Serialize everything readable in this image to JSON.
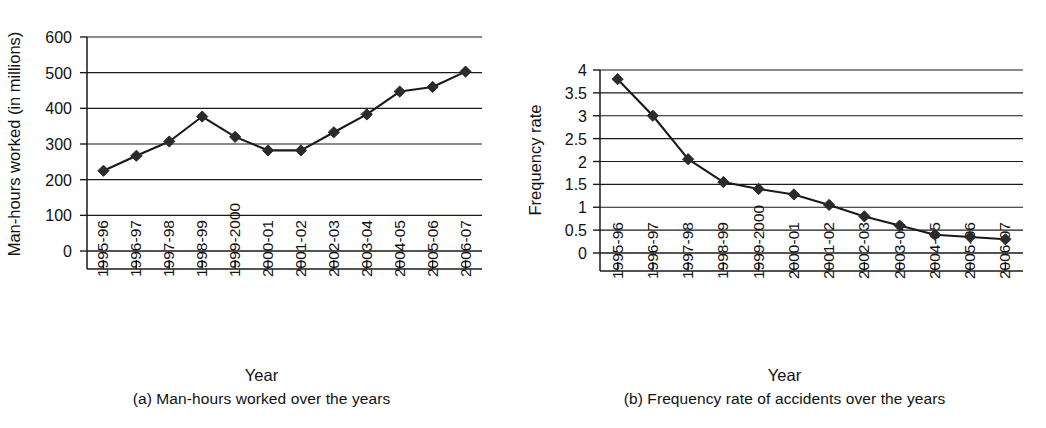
{
  "figure": {
    "panels": [
      {
        "id": "panel-a",
        "caption": "(a) Man-hours worked over the years",
        "xlabel": "Year",
        "ylabel": "Man-hours worked (in millions)"
      },
      {
        "id": "panel-b",
        "caption": "(b) Frequency rate of accidents over the years",
        "xlabel": "Year",
        "ylabel": "Frequency rate"
      }
    ],
    "line_color": "#1a1a1a",
    "marker_color": "#2b2b2b",
    "grid_color": "#1a1a1a",
    "background": "#ffffff"
  },
  "chart_data": [
    {
      "type": "line",
      "title": "(a) Man-hours worked over the years",
      "xlabel": "Year",
      "ylabel": "Man-hours worked (in millions)",
      "categories": [
        "1995-96",
        "1996-97",
        "1997-98",
        "1998-99",
        "1999-2000",
        "2000-01",
        "2001-02",
        "2002-03",
        "2003-04",
        "2004-05",
        "2005-06",
        "2006-07"
      ],
      "values": [
        225,
        267,
        307,
        377,
        320,
        282,
        282,
        333,
        383,
        447,
        460,
        503
      ],
      "yticks": [
        0,
        100,
        200,
        300,
        400,
        500,
        600
      ],
      "ytick_labels": [
        "0",
        "100",
        "200",
        "300",
        "400",
        "500",
        "600"
      ],
      "ylim": [
        0,
        600
      ],
      "grid": true,
      "legend": false,
      "marker": "diamond"
    },
    {
      "type": "line",
      "title": "(b) Frequency rate of accidents over the years",
      "xlabel": "Year",
      "ylabel": "Frequency rate",
      "categories": [
        "1995-96",
        "1996-97",
        "1997-98",
        "1998-99",
        "1999-2000",
        "2000-01",
        "2001-02",
        "2002-03",
        "2003-04",
        "2004-05",
        "2005-06",
        "2006-07"
      ],
      "values": [
        3.8,
        3.0,
        2.05,
        1.55,
        1.4,
        1.28,
        1.05,
        0.8,
        0.6,
        0.4,
        0.35,
        0.3
      ],
      "yticks": [
        0,
        0.5,
        1,
        1.5,
        2,
        2.5,
        3,
        3.5,
        4
      ],
      "ytick_labels": [
        "0",
        "0.5",
        "1",
        "1.5",
        "2",
        "2.5",
        "3",
        "3.5",
        "4"
      ],
      "ylim": [
        0,
        4
      ],
      "grid": true,
      "legend": false,
      "marker": "diamond"
    }
  ]
}
